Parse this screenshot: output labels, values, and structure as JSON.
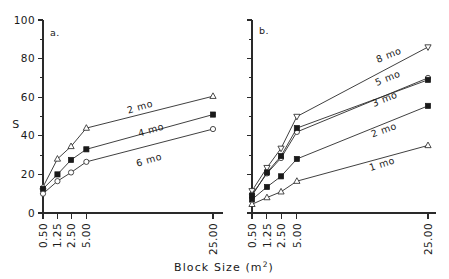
{
  "figure": {
    "xlabel_main": "Block  Size  (m",
    "xlabel_sup": "2",
    "xlabel_tail": ")",
    "ylabel": "S"
  },
  "panels": [
    {
      "key": "a",
      "label": "a.",
      "name": "panel-a"
    },
    {
      "key": "b",
      "label": "b.",
      "name": "panel-b"
    }
  ],
  "axes": {
    "y_ticks_major": [
      "0",
      "20",
      "40",
      "60",
      "80",
      "100"
    ],
    "y_major_values": [
      0,
      20,
      40,
      60,
      80,
      100
    ],
    "y_minor_values": [
      10,
      30,
      50,
      70,
      90
    ],
    "ylim": [
      0,
      100
    ],
    "x_ticks": [
      "0.50",
      "1.25",
      "2.50",
      "5.00",
      "25.00"
    ],
    "x_values": [
      0.5,
      1.25,
      2.5,
      5.0,
      25.0
    ]
  },
  "chart_data": {
    "type": "line",
    "title": "",
    "xlabel": "Block Size (m2)",
    "ylabel": "S",
    "ylim": [
      0,
      100
    ],
    "grid": false,
    "legend_position": "inline-labels",
    "x_scale": "ordinal-spaced",
    "x": [
      0.5,
      1.25,
      2.5,
      5.0,
      25.0
    ],
    "x_tick_labels": [
      "0.50",
      "1.25",
      "2.50",
      "5.00",
      "25.00"
    ],
    "panels": [
      {
        "panel": "a",
        "panel_label": "a.",
        "series": [
          {
            "name": "2 mo",
            "marker": "triangle-open",
            "label": "2 mo",
            "values": [
              13.5,
              28.0,
              34.5,
              44.0,
              60.5
            ]
          },
          {
            "name": "4 mo",
            "marker": "square-filled",
            "label": "4 mo",
            "values": [
              12.5,
              20.0,
              27.5,
              33.0,
              51.0
            ]
          },
          {
            "name": "6 mo",
            "marker": "circle-open",
            "label": "6 mo",
            "values": [
              10.0,
              16.5,
              21.0,
              26.5,
              43.5
            ]
          }
        ]
      },
      {
        "panel": "b",
        "panel_label": "b.",
        "series": [
          {
            "name": "8 mo",
            "marker": "triangle-down-open",
            "label": "8 mo",
            "values": [
              11.5,
              23.5,
              33.5,
              50.0,
              86.0
            ]
          },
          {
            "name": "5 mo",
            "marker": "circle-open",
            "label": "5 mo",
            "values": [
              9.5,
              20.5,
              28.5,
              42.0,
              70.0
            ]
          },
          {
            "name": "3 mo",
            "marker": "square-filled",
            "label": "3 mo",
            "values": [
              9.0,
              21.0,
              29.5,
              44.0,
              69.0
            ]
          },
          {
            "name": "2 mo",
            "marker": "square-filled",
            "label": "2 mo",
            "values": [
              7.0,
              13.5,
              19.0,
              28.0,
              55.5
            ]
          },
          {
            "name": "1 mo",
            "marker": "triangle-open",
            "label": "1 mo",
            "values": [
              4.5,
              8.0,
              11.0,
              16.5,
              35.0
            ]
          }
        ]
      }
    ]
  }
}
